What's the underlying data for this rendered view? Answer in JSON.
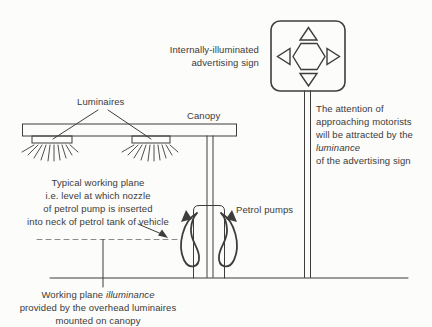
{
  "colors": {
    "ink": "#3d3d3d",
    "dashed_line": "#8a8a8a",
    "background": "#fcfcfa"
  },
  "labels": {
    "luminaires": "Luminaires",
    "canopy": "Canopy",
    "petrol_pumps": "Petrol pumps"
  },
  "sign_caption": {
    "line1": "Internally-illuminated",
    "line2": "advertising sign"
  },
  "attention_note": {
    "line1": "The attention of",
    "line2": "approaching motorists",
    "line3": "will be attracted by the",
    "line4_italic": "luminance",
    "line5": "of the advertising sign"
  },
  "working_plane_note": {
    "line1": "Typical working plane",
    "line2": "i.e. level at which nozzle",
    "line3": "of petrol pump is inserted",
    "line4": "into neck of petrol tank of vehicle"
  },
  "illuminance_note": {
    "line1_prefix": "Working plane ",
    "line1_italic": "illuminance",
    "line2": "provided by the overhead luminaires",
    "line3": "mounted on canopy"
  }
}
